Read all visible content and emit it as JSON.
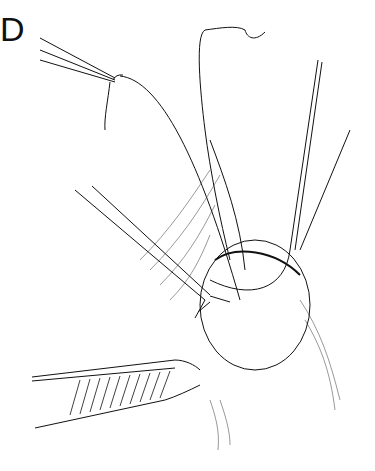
{
  "figure": {
    "panel_label": "D"
  },
  "elements": {
    "suture_forceps": "forceps-holding-suture",
    "retractor_left": "vein-retractor",
    "retractor_right": "blade-retractor",
    "probe": "forked-probe",
    "toothed_forceps": "tissue-forceps",
    "mass": "exposed-tissue-mass"
  },
  "colors": {
    "ink": "#111111",
    "background": "#ffffff"
  }
}
